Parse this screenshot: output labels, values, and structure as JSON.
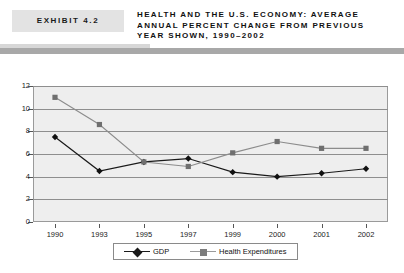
{
  "header": {
    "exhibit_label": "EXHIBIT 4.2",
    "title_lines": [
      "HEALTH AND THE U.S. ECONOMY: AVERAGE",
      "ANNUAL PERCENT CHANGE FROM PREVIOUS",
      "YEAR SHOWN, 1990–2002"
    ]
  },
  "chart_data": {
    "type": "line",
    "xlabel": "",
    "ylabel": "",
    "categories": [
      "1990",
      "1993",
      "1995",
      "1997",
      "1999",
      "2000",
      "2001",
      "2002"
    ],
    "ylim": [
      0,
      12
    ],
    "yticks": [
      0,
      2,
      4,
      6,
      8,
      10,
      12
    ],
    "grid": true,
    "legend_position": "bottom",
    "series": [
      {
        "name": "GDP",
        "color": "#1a1a1a",
        "marker": "diamond",
        "values": [
          7.5,
          4.5,
          5.3,
          5.6,
          4.4,
          4.0,
          4.3,
          4.7
        ]
      },
      {
        "name": "Health Expenditures",
        "color": "#8c8c8c",
        "marker": "square",
        "values": [
          11.0,
          8.6,
          5.3,
          4.9,
          6.1,
          7.1,
          6.5,
          6.5
        ]
      }
    ]
  },
  "colors": {
    "gdp": "#1a1a1a",
    "health": "#8c8c8c",
    "plot_background": "#eeeeee",
    "gridline": "#8e8e8e",
    "header_rule": "#a8a8a8",
    "exhibit_box": "#e3e3e3"
  }
}
